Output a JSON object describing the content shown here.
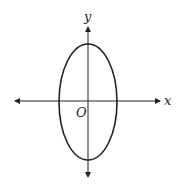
{
  "diagram": {
    "type": "ellipse-on-axes",
    "labels": {
      "x_axis": "x",
      "y_axis": "y",
      "origin": "O"
    },
    "ellipse": {
      "cx": 88,
      "cy": 101,
      "rx": 29.5,
      "ry": 58,
      "orientation": "vertical major axis"
    },
    "colors": {
      "stroke": "#222222",
      "background": "#ffffff"
    }
  }
}
